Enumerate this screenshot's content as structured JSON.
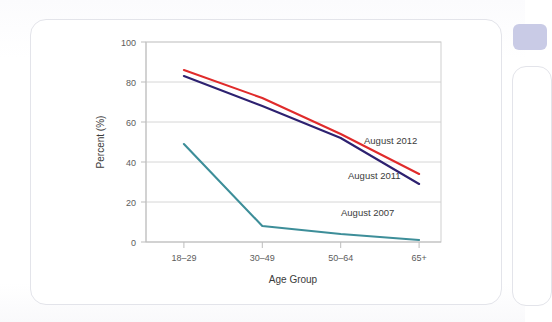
{
  "card": {
    "name": "figure-card"
  },
  "chart_data": {
    "type": "line",
    "title": "",
    "xlabel": "Age Group",
    "ylabel": "Percent (%)",
    "categories": [
      "18–29",
      "30–49",
      "50–64",
      "65+"
    ],
    "ylim": [
      0,
      100
    ],
    "yticks": [
      0,
      20,
      40,
      60,
      80,
      100
    ],
    "ytick_labels": [
      "0",
      "20",
      "40",
      "60",
      "80",
      "100"
    ],
    "grid": true,
    "legend_position": "inline-right",
    "series": [
      {
        "name": "August 2012",
        "color": "#e02b2b",
        "values": [
          86,
          72,
          54,
          34
        ],
        "label": "August 2012"
      },
      {
        "name": "August 2011",
        "color": "#2d2170",
        "values": [
          83,
          68,
          52,
          29
        ],
        "label": "August 2011"
      },
      {
        "name": "August 2007",
        "color": "#3d8e99",
        "values": [
          49,
          8,
          4,
          1
        ],
        "label": "August 2007"
      }
    ],
    "annotations": [
      {
        "text": "August 2012",
        "series": "August 2012"
      },
      {
        "text": "August 2011",
        "series": "August 2011"
      },
      {
        "text": "August 2007",
        "series": "August 2007"
      }
    ]
  },
  "colors": {
    "series_2012": "#e02b2b",
    "series_2011": "#2d2170",
    "series_2007": "#3d8e99",
    "grid": "#d6d6d6",
    "frame": "#cfcfcf",
    "text": "#3b3b3b",
    "card_border": "#e3e4ea",
    "badge": "#c9cbe6"
  }
}
